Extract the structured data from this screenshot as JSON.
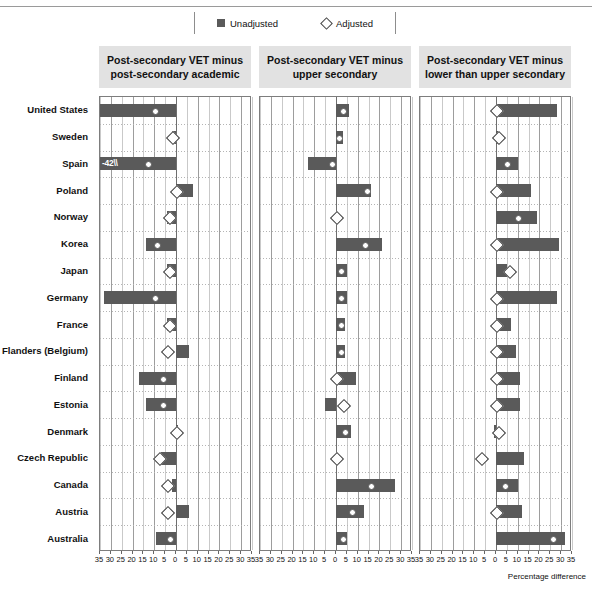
{
  "legend": {
    "items": [
      {
        "label": "Unadjusted",
        "marker": "square-icon",
        "color": "#5a5a5a"
      },
      {
        "label": "Adjusted",
        "marker": "diamond-icon",
        "color": "#ffffff"
      }
    ]
  },
  "axis_caption": "Percentage difference",
  "panels": [
    {
      "id": "panel-1",
      "title": "Post-secondary VET minus post-secondary academic"
    },
    {
      "id": "panel-2",
      "title": "Post-secondary VET minus upper secondary"
    },
    {
      "id": "panel-3",
      "title": "Post-secondary VET minus lower than upper secondary"
    }
  ],
  "axis": {
    "ticks": [
      -35,
      -30,
      -25,
      -20,
      -15,
      -10,
      -5,
      0,
      5,
      10,
      15,
      20,
      25,
      30,
      35
    ],
    "tick_labels": [
      "35",
      "30",
      "25",
      "20",
      "15",
      "10",
      "5",
      "0",
      "5",
      "10",
      "15",
      "20",
      "25",
      "30",
      "35"
    ],
    "min": -35,
    "max": 35
  },
  "chart_data": {
    "type": "bar",
    "xlabel": "Percentage difference",
    "ylabel": "",
    "xlim": [
      -35,
      35
    ],
    "grid": true,
    "legend_position": "top",
    "categories": [
      "United States",
      "Sweden",
      "Spain",
      "Poland",
      "Norway",
      "Korea",
      "Japan",
      "Germany",
      "France",
      "Flanders (Belgium)",
      "Finland",
      "Estonia",
      "Denmark",
      "Czech Republic",
      "Canada",
      "Austria",
      "Australia"
    ],
    "panels": [
      {
        "name": "Post-secondary VET minus post-secondary academic",
        "series": [
          {
            "name": "Unadjusted",
            "values": [
              -35,
              -2,
              -42,
              8,
              -4,
              -14,
              -4,
              -33,
              -4,
              6,
              -17,
              -14,
              1,
              -7,
              -2,
              6,
              -9
            ]
          },
          {
            "name": "Adjusted",
            "values": [
              -10,
              -2,
              -13,
              0,
              -3,
              -9,
              -3,
              -10,
              -3,
              -4,
              -6,
              -6,
              0,
              -8,
              -4,
              -4,
              -3
            ]
          }
        ],
        "notes": [
          {
            "category": "Spain",
            "series": "Unadjusted",
            "label": "-42",
            "truncated": true
          }
        ]
      },
      {
        "name": "Post-secondary VET minus upper secondary",
        "series": [
          {
            "name": "Unadjusted",
            "values": [
              6,
              3,
              -13,
              16,
              0,
              21,
              5,
              5,
              4,
              4,
              9,
              -5,
              7,
              0,
              27,
              13,
              5
            ]
          },
          {
            "name": "Adjusted",
            "values": [
              3,
              1,
              -2,
              14,
              0,
              13,
              2,
              2,
              2,
              2,
              0,
              3,
              4,
              0,
              16,
              7,
              3
            ]
          }
        ],
        "notes": []
      },
      {
        "name": "Post-secondary VET minus lower than upper secondary",
        "series": [
          {
            "name": "Unadjusted",
            "values": [
              28,
              1,
              10,
              16,
              19,
              29,
              5,
              28,
              7,
              9,
              11,
              11,
              -1,
              13,
              10,
              12,
              32,
              1
            ]
          },
          {
            "name": "Adjusted",
            "values": [
              0,
              1,
              5,
              0,
              10,
              0,
              6,
              0,
              0,
              0,
              0,
              0,
              1,
              -7,
              4,
              0,
              26,
              1
            ]
          }
        ],
        "notes": []
      }
    ]
  }
}
